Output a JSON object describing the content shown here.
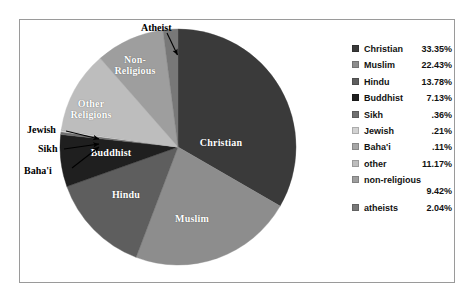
{
  "chart_data": {
    "type": "pie",
    "title": "",
    "categories": [
      "Christian",
      "Muslim",
      "Hindu",
      "Buddhist",
      "Sikh",
      "Jewish",
      "Baha'i",
      "other",
      "non-religious",
      "atheists"
    ],
    "values": [
      33.35,
      22.43,
      13.78,
      7.13,
      0.36,
      0.21,
      0.11,
      11.17,
      9.42,
      2.04
    ],
    "value_labels": [
      "33.35%",
      "22.43%",
      "13.78%",
      "7.13%",
      ".36%",
      ".21%",
      ".11%",
      "11.17%",
      "9.42%",
      "2.04%"
    ],
    "colors": [
      "#3a3a3a",
      "#8d8d8d",
      "#5e5e5e",
      "#1f1f1f",
      "#6f6f6f",
      "#d2d2d2",
      "#a6a6a6",
      "#bdbdbd",
      "#9e9e9e",
      "#787878"
    ],
    "legend_position": "right",
    "grid": false,
    "start_angle_deg": 0,
    "direction": "clockwise"
  },
  "pie": {
    "slice_labels": [
      {
        "name": "Christian",
        "text": "Christian"
      },
      {
        "name": "Muslim",
        "text": "Muslim"
      },
      {
        "name": "Hindu",
        "text": "Hindu"
      },
      {
        "name": "Buddhist",
        "text": "Buddhist"
      },
      {
        "name": "Other Religions",
        "text": "Other\nReligions"
      },
      {
        "name": "Non-Religious",
        "text": "Non-\nReligious"
      }
    ],
    "label_christian": "Christian",
    "label_muslim": "Muslim",
    "label_hindu": "Hindu",
    "label_buddhist": "Buddhist",
    "label_other_religions_line1": "Other",
    "label_other_religions_line2": "Religions",
    "label_nonreligious_line1": "Non-",
    "label_nonreligious_line2": "Religious",
    "callouts": {
      "atheist": "Atheist",
      "jewish": "Jewish",
      "sikh": "Sikh",
      "bahai": "Baha'i"
    }
  },
  "legend": {
    "items": [
      {
        "label": "Christian",
        "value": "33.35%",
        "color": "#3a3a3a",
        "stacked": false
      },
      {
        "label": "Muslim",
        "value": "22.43%",
        "color": "#8d8d8d",
        "stacked": false
      },
      {
        "label": "Hindu",
        "value": "13.78%",
        "color": "#5e5e5e",
        "stacked": false
      },
      {
        "label": "Buddhist",
        "value": "7.13%",
        "color": "#1f1f1f",
        "stacked": false
      },
      {
        "label": "Sikh",
        "value": ".36%",
        "color": "#6f6f6f",
        "stacked": false
      },
      {
        "label": "Jewish",
        "value": ".21%",
        "color": "#d2d2d2",
        "stacked": false
      },
      {
        "label": "Baha'i",
        "value": ".11%",
        "color": "#a6a6a6",
        "stacked": false
      },
      {
        "label": "other",
        "value": "11.17%",
        "color": "#bdbdbd",
        "stacked": false
      },
      {
        "label": "non-religious",
        "value": "9.42%",
        "color": "#9e9e9e",
        "stacked": true
      },
      {
        "label": "atheists",
        "value": "2.04%",
        "color": "#787878",
        "stacked": false
      }
    ]
  }
}
